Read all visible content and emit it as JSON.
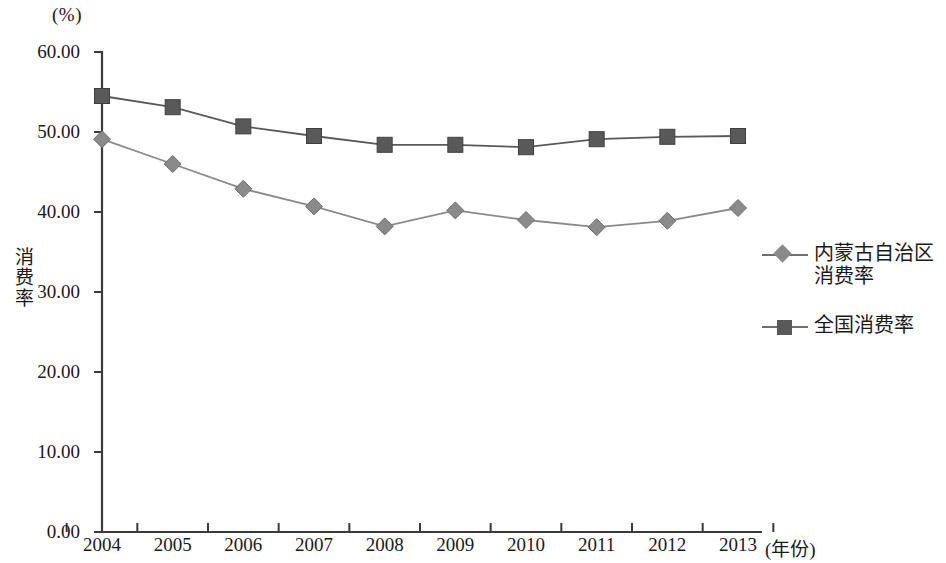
{
  "chart_data": {
    "type": "line",
    "title": "",
    "unit_label": "(%)",
    "xlabel": "(年份)",
    "ylabel": "消费率",
    "categories": [
      "2004",
      "2005",
      "2006",
      "2007",
      "2008",
      "2009",
      "2010",
      "2011",
      "2012",
      "2013"
    ],
    "ylim": [
      0,
      60
    ],
    "ytick_labels": [
      "0.00",
      "10.00",
      "20.00",
      "30.00",
      "40.00",
      "50.00",
      "60.00"
    ],
    "ytick_values": [
      0,
      10,
      20,
      30,
      40,
      50,
      60
    ],
    "grid": false,
    "legend_position": "right",
    "series": [
      {
        "name": "内蒙古自治区\n消费率",
        "marker": "diamond",
        "color": "#8a8a8a",
        "line_color": "#8a8a8a",
        "values": [
          49.1,
          46.0,
          42.9,
          40.7,
          38.2,
          40.2,
          39.0,
          38.1,
          38.9,
          40.5
        ]
      },
      {
        "name": "全国消费率",
        "marker": "square",
        "color": "#595959",
        "line_color": "#595959",
        "values": [
          54.5,
          53.1,
          50.7,
          49.5,
          48.4,
          48.4,
          48.1,
          49.1,
          49.4,
          49.5
        ]
      }
    ]
  },
  "axis": {
    "axis_color": "#3a3a3a"
  }
}
